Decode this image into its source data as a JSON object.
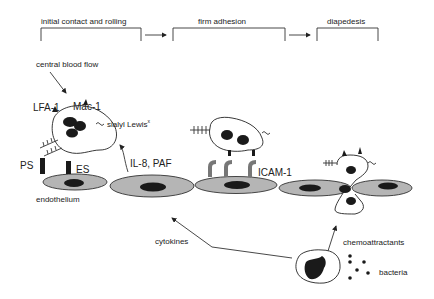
{
  "stages": [
    {
      "label": "initial contact and rolling"
    },
    {
      "label": "firm adhesion"
    },
    {
      "label": "diapedesis"
    }
  ],
  "labels": {
    "central_blood_flow": "central blood flow",
    "lfa1": "LFA-1",
    "mac1": "Mac-1",
    "sialyl_lewis": "sialyl Lewis",
    "sialyl_lewis_sup": "x",
    "ps": "PS",
    "es": "ES",
    "endothelium": "endothelium",
    "il8_paf": "IL-8, PAF",
    "icam1": "ICAM-1",
    "cytokines": "cytokines",
    "chemoattractants": "chemoattractants",
    "bacteria": "bacteria"
  },
  "colors": {
    "cell_fill": "#b5b5b5",
    "nucleus": "#1a1a1a",
    "line": "#333333"
  }
}
